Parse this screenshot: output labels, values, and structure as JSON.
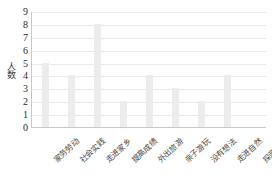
{
  "chart_data": {
    "type": "bar",
    "title": "",
    "xlabel": "",
    "ylabel": "人数",
    "ylim": [
      0,
      9
    ],
    "grid": true,
    "legend": false,
    "categories": [
      "家务劳动",
      "社会实践",
      "走进家乡",
      "提高成绩",
      "外出旅游",
      "亲子游玩",
      "没有想法",
      "走进自然",
      "探亲访友"
    ],
    "values": [
      5,
      4,
      8,
      2,
      4,
      3,
      2,
      4,
      0
    ],
    "y_ticks": [
      "9",
      "8",
      "7",
      "6",
      "5",
      "4",
      "3",
      "2",
      "1",
      "0"
    ],
    "bar_color": "#ececec",
    "gridline_color": "#e9e9e9",
    "axis_color": "#c8c8c8",
    "background_color": "#ffffff"
  }
}
